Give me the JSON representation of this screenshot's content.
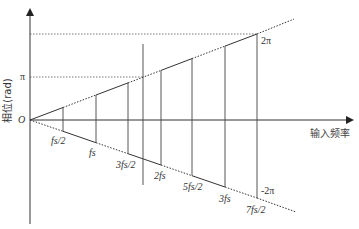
{
  "figure": {
    "type": "phase-vs-input-frequency aliasing diagram",
    "y_axis_label": "相位(rad)",
    "x_axis_label": "输入频率",
    "origin_label": "O",
    "y_ticks": [
      {
        "label": "π",
        "value": "pi"
      },
      {
        "label": "2π",
        "value": "2pi"
      }
    ],
    "upper_markers": [
      {
        "label": "2π"
      }
    ],
    "lower_markers": [
      {
        "label": "-2π"
      }
    ],
    "frequency_labels": [
      "fs/2",
      "fs",
      "3fs/2",
      "2fs",
      "5fs/2",
      "3fs",
      "7fs/2"
    ],
    "freq_label_parts": [
      {
        "num": "f",
        "sub": "s",
        "tail": "/2"
      },
      {
        "num": "f",
        "sub": "s",
        "tail": ""
      },
      {
        "pre": "3",
        "num": "f",
        "sub": "s",
        "tail": "/2"
      },
      {
        "pre": "2",
        "num": "f",
        "sub": "s",
        "tail": ""
      },
      {
        "pre": "5",
        "num": "f",
        "sub": "s",
        "tail": "/2"
      },
      {
        "pre": "3",
        "num": "f",
        "sub": "s",
        "tail": ""
      },
      {
        "pre": "7",
        "num": "f",
        "sub": "s",
        "tail": "/2"
      }
    ],
    "colors": {
      "line": "#333333",
      "dotted": "#555555",
      "background": "#ffffff"
    }
  }
}
